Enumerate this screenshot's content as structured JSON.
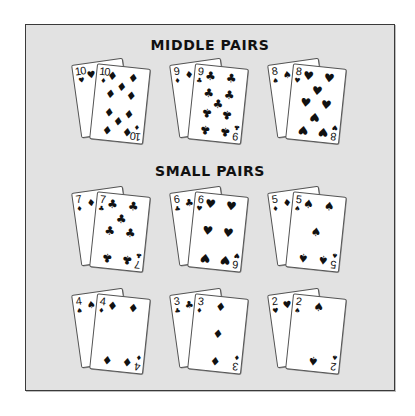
{
  "sections": [
    {
      "title": "MIDDLE PAIRS",
      "pairs": [
        {
          "rank": "10",
          "back_suit": "♥",
          "front_suit": "♦"
        },
        {
          "rank": "9",
          "back_suit": "♦",
          "front_suit": "♣"
        },
        {
          "rank": "8",
          "back_suit": "♠",
          "front_suit": "♥"
        }
      ]
    },
    {
      "title": "SMALL PAIRS",
      "pairs": [
        {
          "rank": "7",
          "back_suit": "♦",
          "front_suit": "♣"
        },
        {
          "rank": "6",
          "back_suit": "♣",
          "front_suit": "♥"
        },
        {
          "rank": "5",
          "back_suit": "♦",
          "front_suit": "♠"
        },
        {
          "rank": "4",
          "back_suit": "♠",
          "front_suit": "♦"
        },
        {
          "rank": "3",
          "back_suit": "♣",
          "front_suit": "♦"
        },
        {
          "rank": "2",
          "back_suit": "♥",
          "front_suit": "♠"
        }
      ]
    }
  ],
  "colors": {
    "panel_bg": "#e2e2e2",
    "panel_border": "#3a3a3a",
    "card_bg": "#ffffff",
    "ink": "#111111"
  }
}
